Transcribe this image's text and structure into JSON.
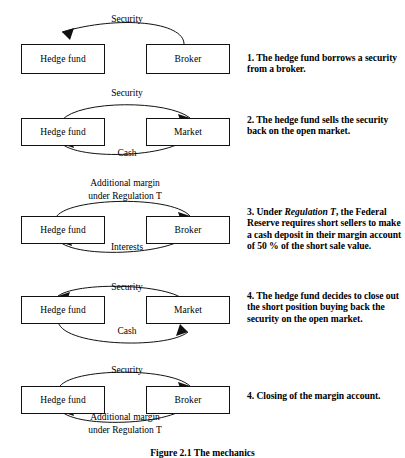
{
  "figure": {
    "caption": "Figure 2.1   The mechanics",
    "panels": [
      {
        "id": "panel-1",
        "left_node": "Hedge fund",
        "right_node": "Broker",
        "top_label": "Security",
        "top_label_2": "",
        "bottom_label": "",
        "bottom_label_2": "",
        "caption_prefix": "1. The hedge fund borrows a security from a broker.",
        "caption_parts": [
          {
            "text": "1. The hedge fund borrows a security from a broker.",
            "italic": false
          }
        ]
      },
      {
        "id": "panel-2",
        "left_node": "Hedge fund",
        "right_node": "Market",
        "top_label": "Security",
        "top_label_2": "",
        "bottom_label": "Cash",
        "bottom_label_2": "",
        "caption_parts": [
          {
            "text": "2. The hedge fund sells the security back on the open market.",
            "italic": false
          }
        ]
      },
      {
        "id": "panel-3",
        "left_node": "Hedge fund",
        "right_node": "Broker",
        "top_label": "Additional margin",
        "top_label_2": "under Regulation T",
        "bottom_label": "Interests",
        "bottom_label_2": "",
        "caption_parts": [
          {
            "text": "3. Under ",
            "italic": false
          },
          {
            "text": "Regulation T",
            "italic": true
          },
          {
            "text": ", the Federal Reserve requires short sellers to make a cash deposit in their margin account of 50 % of the short sale value.",
            "italic": false
          }
        ]
      },
      {
        "id": "panel-4",
        "left_node": "Hedge fund",
        "right_node": "Market",
        "top_label": "Security",
        "top_label_2": "",
        "bottom_label": "Cash",
        "bottom_label_2": "",
        "caption_parts": [
          {
            "text": "4. The hedge fund decides to close out the short position buying back the security on the open market.",
            "italic": false
          }
        ]
      },
      {
        "id": "panel-5",
        "left_node": "Hedge fund",
        "right_node": "Broker",
        "top_label": "Security",
        "top_label_2": "",
        "bottom_label": "Additional margin",
        "bottom_label_2": "under Regulation T",
        "caption_parts": [
          {
            "text": "4. Closing of the margin account.",
            "italic": false
          }
        ]
      }
    ]
  },
  "colors": {
    "stroke": "#111111",
    "background": "#ffffff",
    "text": "#000000"
  }
}
